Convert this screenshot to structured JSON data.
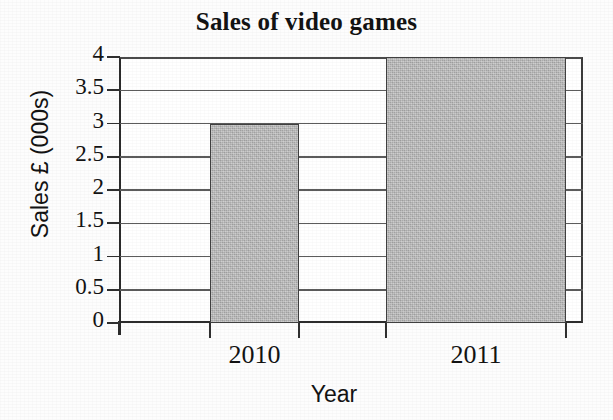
{
  "chart_data": {
    "type": "bar",
    "title": "Sales of video games",
    "xlabel": "Year",
    "ylabel": "Sales £ (000s)",
    "categories": [
      "2010",
      "2011"
    ],
    "values": [
      3,
      4
    ],
    "ylim": [
      0,
      4
    ],
    "ytick_labels": [
      "0",
      "0.5",
      "1",
      "1.5",
      "2",
      "2.5",
      "3",
      "3.5",
      "4"
    ],
    "ytick_values": [
      0,
      0.5,
      1,
      1.5,
      2,
      2.5,
      3,
      3.5,
      4
    ],
    "grid": true,
    "legend": "none",
    "series": [
      {
        "name": "Sales",
        "values": [
          3,
          4
        ],
        "bar_color": "#b9b9b9",
        "bar_edge_color": "#404040"
      }
    ],
    "colors": {
      "background": "#fdfdfd",
      "plot_background": "#ffffff",
      "axis": "#2b2b2b",
      "gridline": "#5c5c5c",
      "text": "#131313",
      "bar_fill": "#b9b9b9",
      "bar_stroke": "#404040"
    }
  }
}
